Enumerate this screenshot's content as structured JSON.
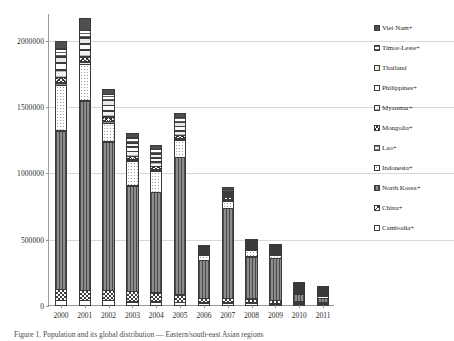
{
  "figure": {
    "caption": "Figure 1. Population and its global distribution — Eastern/south-east Asian regions",
    "background": "#ffffff"
  },
  "chart_data": {
    "type": "bar",
    "stacked": true,
    "title": "",
    "xlabel": "",
    "ylabel": "",
    "grid": true,
    "legend_position": "right",
    "ylim": [
      0,
      2200000
    ],
    "yticks": [
      0,
      500000,
      1000000,
      1500000,
      2000000
    ],
    "ytick_labels": [
      "0",
      "500000",
      "1000000",
      "1500000",
      "2000000"
    ],
    "categories": [
      "2000",
      "2001",
      "2002",
      "2003",
      "2004",
      "2005",
      "2006",
      "2007",
      "2008",
      "2009",
      "2010",
      "2011"
    ],
    "stack_order_bottom_to_top": [
      "Cambodia+",
      "China+",
      "North Korea+",
      "Indonesia+",
      "Lao+",
      "Mongolia+",
      "Myanmar+",
      "Philippines+",
      "Thailand",
      "Timor-Leste+",
      "Viet Nam+"
    ],
    "series": [
      {
        "name": "Cambodia+",
        "pattern": "solid-white",
        "values": [
          40000,
          40000,
          40000,
          30000,
          30000,
          25000,
          20000,
          20000,
          20000,
          15000,
          12000,
          10000
        ]
      },
      {
        "name": "China+",
        "pattern": "checkerboard",
        "values": [
          85000,
          80000,
          80000,
          80000,
          70000,
          60000,
          40000,
          40000,
          35000,
          30000,
          18000,
          15000
        ]
      },
      {
        "name": "North Korea+",
        "pattern": "vertical-stripes",
        "values": [
          1200000,
          1430000,
          1120000,
          800000,
          760000,
          1040000,
          290000,
          680000,
          320000,
          320000,
          100000,
          80000
        ]
      },
      {
        "name": "Indonesia+",
        "pattern": "dotted-white",
        "values": [
          345000,
          280000,
          145000,
          190000,
          165000,
          130000,
          40000,
          60000,
          55000,
          30000,
          15000,
          18000
        ]
      },
      {
        "name": "Lao+",
        "pattern": "fine-horizontal",
        "values": [
          25000,
          22000,
          18000,
          15000,
          14000,
          12000,
          8000,
          9000,
          8000,
          6000,
          3000,
          2500
        ]
      },
      {
        "name": "Mongolia+",
        "pattern": "cross-hatch",
        "values": [
          45000,
          42000,
          38000,
          30000,
          28000,
          30000,
          12000,
          22000,
          14000,
          12000,
          5000,
          4000
        ]
      },
      {
        "name": "Myanmar+",
        "pattern": "light-horizontal",
        "values": [
          60000,
          55000,
          48000,
          40000,
          38000,
          40000,
          12000,
          20000,
          15000,
          12000,
          4000,
          3500
        ]
      },
      {
        "name": "Philippines+",
        "pattern": "solid-very-light",
        "values": [
          55000,
          50000,
          45000,
          38000,
          35000,
          38000,
          10000,
          18000,
          12000,
          10000,
          3500,
          3000
        ]
      },
      {
        "name": "Thailand",
        "pattern": "fine-dots",
        "values": [
          50000,
          48000,
          42000,
          35000,
          32000,
          35000,
          9000,
          16000,
          11000,
          9000,
          3000,
          2500
        ]
      },
      {
        "name": "Timor-Leste+",
        "pattern": "horizontal-lines",
        "values": [
          65000,
          62000,
          50000,
          42000,
          38000,
          40000,
          10000,
          18000,
          12000,
          10000,
          3500,
          3000
        ]
      },
      {
        "name": "Viet Nam+",
        "pattern": "solid-dark",
        "values": [
          60000,
          95000,
          45000,
          40000,
          35000,
          35000,
          12000,
          20000,
          10000,
          10000,
          3000,
          2500
        ]
      }
    ],
    "totals": [
      2030000,
      2204000,
      1671000,
      1340000,
      1245000,
      1485000,
      463000,
      923000,
      512000,
      464000,
      170000,
      144000
    ]
  },
  "legend": {
    "items": [
      {
        "label": "Viet Nam+",
        "pattern_class": "p-vietnam"
      },
      {
        "label": "Timor-Leste+",
        "pattern_class": "p-timorleste"
      },
      {
        "label": "Thailand",
        "pattern_class": "p-thailand"
      },
      {
        "label": "Philippines+",
        "pattern_class": "p-philippines"
      },
      {
        "label": "Myanmar+",
        "pattern_class": "p-myanmar"
      },
      {
        "label": "Mongolia+",
        "pattern_class": "p-mongolia"
      },
      {
        "label": "Lao+",
        "pattern_class": "p-lao"
      },
      {
        "label": "Indonesia+",
        "pattern_class": "p-indonesia"
      },
      {
        "label": "North Korea+",
        "pattern_class": "p-northkorea"
      },
      {
        "label": "China+",
        "pattern_class": "p-china"
      },
      {
        "label": "Cambodia+",
        "pattern_class": "p-cambodia"
      }
    ]
  }
}
